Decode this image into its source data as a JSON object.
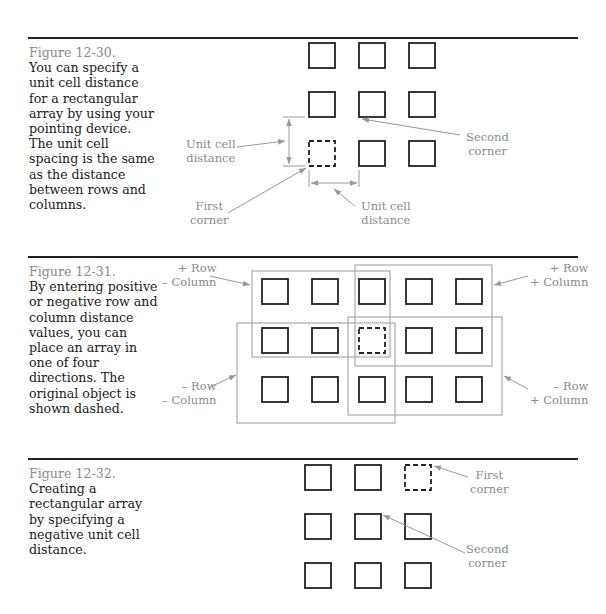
{
  "figures": [
    {
      "id": "12-30",
      "title": "Figure 12-30.",
      "caption": "You can specify a unit cell distance for a rectangular array by using your pointing device. The unit cell spacing is the same as the distance between rows and columns.",
      "labels": {
        "unit_cell_distance_left": [
          "Unit cell",
          "distance"
        ],
        "second_corner": [
          "Second",
          "corner"
        ],
        "first_corner": [
          "First",
          "corner"
        ],
        "unit_cell_distance_bottom": [
          "Unit cell",
          "distance"
        ]
      }
    },
    {
      "id": "12-31",
      "title": "Figure 12-31.",
      "caption": "By entering positive or negative row and column distance values, you can place an array in one of four directions. The original object is shown dashed.",
      "labels": {
        "top_left": [
          "+ Row",
          "– Column"
        ],
        "top_right": [
          "+ Row",
          "+ Column"
        ],
        "bottom_left": [
          "– Row",
          "– Column"
        ],
        "bottom_right": [
          "– Row",
          "+ Column"
        ]
      }
    },
    {
      "id": "12-32",
      "title": "Figure 12-32.",
      "caption": "Creating a rectangular array by specifying a negative unit cell distance.",
      "labels": {
        "first_corner": [
          "First",
          "corner"
        ],
        "second_corner": [
          "Second",
          "corner"
        ]
      }
    }
  ],
  "colors": {
    "text": "#1a1a1a",
    "label_gray": "#8a8a8a",
    "line": "#222222",
    "leader": "#999999"
  }
}
